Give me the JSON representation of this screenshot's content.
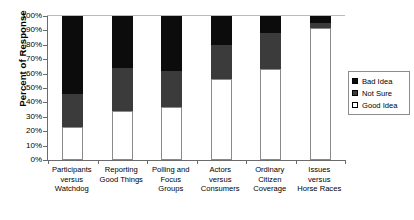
{
  "chart_data": {
    "type": "bar",
    "subtype": "stacked-100-percent",
    "title": "",
    "xlabel": "",
    "ylabel": "Percent of Response",
    "ylim": [
      0,
      100
    ],
    "ytick_labels": [
      "100%",
      "90%",
      "80%",
      "70%",
      "60%",
      "50%",
      "40%",
      "30%",
      "20%",
      "10%",
      "0%"
    ],
    "ytick_values": [
      100,
      90,
      80,
      70,
      60,
      50,
      40,
      30,
      20,
      10,
      0
    ],
    "grid": false,
    "legend_position": "right",
    "categories": [
      "Participants versus Watchdog",
      "Reporting Good Things",
      "Polling and Focus Groups",
      "Actors versus Consumers",
      "Ordinary Citizen Coverage",
      "Issues versus Horse Races"
    ],
    "category_lines": [
      [
        "Participants",
        "versus",
        "Watchdog"
      ],
      [
        "Reporting",
        "Good Things"
      ],
      [
        "Polling and",
        "Focus",
        "Groups"
      ],
      [
        "Actors",
        "versus",
        "Consumers"
      ],
      [
        "Ordinary",
        "Citizen",
        "Coverage"
      ],
      [
        "Issues",
        "versus",
        "Horse Races"
      ]
    ],
    "series": [
      {
        "name": "Good Idea",
        "color": "#ffffff",
        "values": [
          23,
          34,
          37,
          56,
          63,
          92
        ]
      },
      {
        "name": "Not Sure",
        "color": "#3b3b3b",
        "values": [
          23,
          30,
          25,
          24,
          25,
          3
        ]
      },
      {
        "name": "Bad Idea",
        "color": "#0c0c0c",
        "values": [
          54,
          36,
          38,
          20,
          12,
          5
        ]
      }
    ],
    "stack_order_bottom_to_top": [
      "Good Idea",
      "Not Sure",
      "Bad Idea"
    ]
  },
  "legend": {
    "items": [
      {
        "label": "Bad Idea",
        "color": "#0c0c0c"
      },
      {
        "label": "Not Sure",
        "color": "#3b3b3b"
      },
      {
        "label": "Good Idea",
        "color": "#ffffff"
      }
    ]
  }
}
